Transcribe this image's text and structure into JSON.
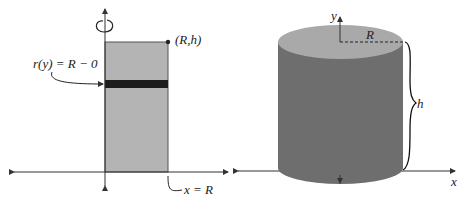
{
  "left_panel": {
    "point_label": "(R,h)",
    "radius_label": "r(y) = R − 0",
    "x_label": "x = R",
    "colors": {
      "region": "#b4b4b4",
      "strip": "#1c1c1c",
      "axis": "#333333"
    }
  },
  "right_panel": {
    "y_axis_label": "y",
    "radius_label": "R",
    "height_label": "h",
    "x_axis_label": "x",
    "colors": {
      "top": "#a9a9a9",
      "side": "#6e6e6e",
      "axis": "#333333"
    }
  },
  "icons": [
    "rotation-arrow-icon",
    "curly-brace-icon"
  ]
}
